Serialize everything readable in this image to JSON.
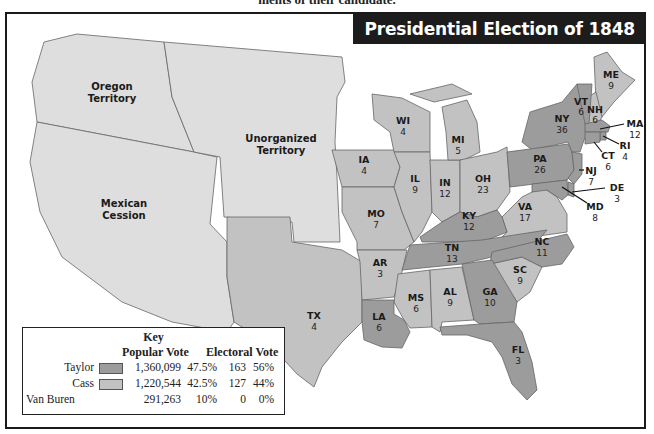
{
  "caption": "ments of their candidate.",
  "title": "Presidential Election of 1848",
  "colors": {
    "taylor": "#9c9c9c",
    "cass": "#c2c2c2",
    "territory": "#dedede",
    "water": "#ffffff",
    "border": "#555555"
  },
  "territories": [
    {
      "id": "oregon",
      "line1": "Oregon",
      "line2": "Territory"
    },
    {
      "id": "unorganized",
      "line1": "Unorganized",
      "line2": "Territory"
    },
    {
      "id": "mexican",
      "line1": "Mexican",
      "line2": "Cession"
    }
  ],
  "states": [
    {
      "abbr": "ME",
      "ev": "9",
      "winner": "cass"
    },
    {
      "abbr": "VT",
      "ev": "6",
      "winner": "taylor"
    },
    {
      "abbr": "NH",
      "ev": "6",
      "winner": "cass"
    },
    {
      "abbr": "MA",
      "ev": "12",
      "winner": "taylor"
    },
    {
      "abbr": "RI",
      "ev": "4",
      "winner": "taylor"
    },
    {
      "abbr": "CT",
      "ev": "6",
      "winner": "taylor"
    },
    {
      "abbr": "NY",
      "ev": "36",
      "winner": "taylor"
    },
    {
      "abbr": "NJ",
      "ev": "7",
      "winner": "taylor"
    },
    {
      "abbr": "PA",
      "ev": "26",
      "winner": "taylor"
    },
    {
      "abbr": "DE",
      "ev": "3",
      "winner": "taylor"
    },
    {
      "abbr": "MD",
      "ev": "8",
      "winner": "taylor"
    },
    {
      "abbr": "VA",
      "ev": "17",
      "winner": "cass"
    },
    {
      "abbr": "NC",
      "ev": "11",
      "winner": "taylor"
    },
    {
      "abbr": "SC",
      "ev": "9",
      "winner": "cass"
    },
    {
      "abbr": "GA",
      "ev": "10",
      "winner": "taylor"
    },
    {
      "abbr": "FL",
      "ev": "3",
      "winner": "taylor"
    },
    {
      "abbr": "AL",
      "ev": "9",
      "winner": "cass"
    },
    {
      "abbr": "MS",
      "ev": "6",
      "winner": "cass"
    },
    {
      "abbr": "LA",
      "ev": "6",
      "winner": "taylor"
    },
    {
      "abbr": "TN",
      "ev": "13",
      "winner": "taylor"
    },
    {
      "abbr": "KY",
      "ev": "12",
      "winner": "taylor"
    },
    {
      "abbr": "OH",
      "ev": "23",
      "winner": "cass"
    },
    {
      "abbr": "IN",
      "ev": "12",
      "winner": "cass"
    },
    {
      "abbr": "IL",
      "ev": "9",
      "winner": "cass"
    },
    {
      "abbr": "MI",
      "ev": "5",
      "winner": "cass"
    },
    {
      "abbr": "WI",
      "ev": "4",
      "winner": "cass"
    },
    {
      "abbr": "IA",
      "ev": "4",
      "winner": "cass"
    },
    {
      "abbr": "MO",
      "ev": "7",
      "winner": "cass"
    },
    {
      "abbr": "AR",
      "ev": "3",
      "winner": "cass"
    },
    {
      "abbr": "TX",
      "ev": "4",
      "winner": "cass"
    }
  ],
  "key": {
    "title": "Key",
    "popular_header": "Popular Vote",
    "electoral_header": "Electoral Vote",
    "rows": [
      {
        "candidate": "Taylor",
        "swatch": "taylor",
        "popular": "1,360,099",
        "popular_pct": "47.5%",
        "electoral": "163",
        "electoral_pct": "56%"
      },
      {
        "candidate": "Cass",
        "swatch": "cass",
        "popular": "1,220,544",
        "popular_pct": "42.5%",
        "electoral": "127",
        "electoral_pct": "44%"
      },
      {
        "candidate": "Van Buren",
        "swatch": null,
        "popular": "291,263",
        "popular_pct": "10%",
        "electoral": "0",
        "electoral_pct": "0%"
      }
    ]
  }
}
